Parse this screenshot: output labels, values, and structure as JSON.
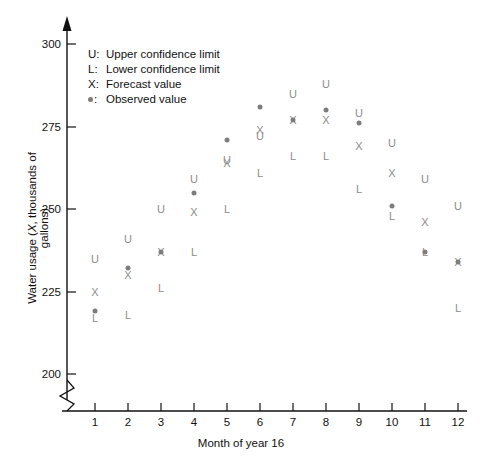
{
  "chart_data": {
    "type": "scatter",
    "title": "",
    "xlabel": "Month of year 16",
    "ylabel": "Water usage (X, thousands of gallons)",
    "ylabel_parts": {
      "prefix": "Water usage (",
      "italic": "X",
      "suffix": ", thousands of gallons)"
    },
    "categories": [
      1,
      2,
      3,
      4,
      5,
      6,
      7,
      8,
      9,
      10,
      11,
      12
    ],
    "x": [
      1,
      2,
      3,
      4,
      5,
      6,
      7,
      8,
      9,
      10,
      11,
      12
    ],
    "xlim": [
      0.5,
      12.5
    ],
    "ylim": [
      200,
      305
    ],
    "yticks": [
      200,
      225,
      250,
      275,
      300
    ],
    "xticks": [
      1,
      2,
      3,
      4,
      5,
      6,
      7,
      8,
      9,
      10,
      11,
      12
    ],
    "grid": false,
    "axis_break": true,
    "axis_break_note": "y-axis broken below 200",
    "legend_position": "upper-left inside plot",
    "series": [
      {
        "name": "Upper confidence limit",
        "symbol": "U",
        "values": [
          235,
          241,
          250,
          259,
          265,
          272,
          285,
          288,
          279,
          270,
          259,
          251
        ]
      },
      {
        "name": "Forecast value",
        "symbol": "X",
        "values": [
          225,
          230,
          237,
          249,
          264,
          274,
          277,
          277,
          269,
          261,
          246,
          234
        ]
      },
      {
        "name": "Lower confidence limit",
        "symbol": "L",
        "values": [
          217,
          218,
          226,
          237,
          250,
          261,
          266,
          266,
          256,
          248,
          237,
          220
        ]
      },
      {
        "name": "Observed value",
        "symbol": "dot",
        "values": [
          219,
          232,
          237,
          255,
          271,
          281,
          277,
          280,
          276,
          251,
          237,
          234
        ]
      }
    ],
    "legend": [
      {
        "key": "U",
        "label": "Upper confidence limit"
      },
      {
        "key": "L",
        "label": "Lower confidence limit"
      },
      {
        "key": "X",
        "label": "Forecast value"
      },
      {
        "key": "dot",
        "label": "Observed value"
      }
    ],
    "colors": {
      "axis": "#111111",
      "marker": "#8c8c8c",
      "dot": "#7d7d7d"
    }
  }
}
